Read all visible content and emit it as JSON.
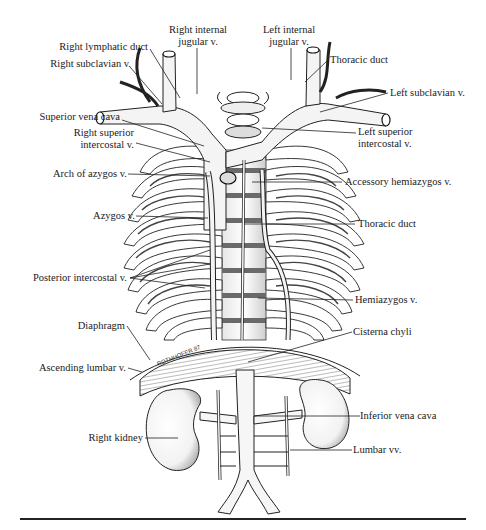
{
  "figure": {
    "signature": "ROTHHOFER 87",
    "caption_partial": "Figure 5.1"
  },
  "labels_left": {
    "right_lymphatic_duct": "Right lymphatic duct",
    "right_subclavian": "Right subclavian v.",
    "superior_vena_cava": "Superior vena cava",
    "right_superior_intercostal_1": "Right superior",
    "right_superior_intercostal_2": "intercostal v.",
    "arch_of_azygos": "Arch of azygos v.",
    "azygos": "Azygos v.",
    "posterior_intercostal": "Posterior intercostal v.",
    "diaphragm": "Diaphragm",
    "ascending_lumbar": "Ascending lumbar v.",
    "right_kidney": "Right kidney"
  },
  "labels_top": {
    "right_internal_jugular_1": "Right internal",
    "right_internal_jugular_2": "jugular v.",
    "left_internal_jugular_1": "Left internal",
    "left_internal_jugular_2": "jugular v."
  },
  "labels_right": {
    "thoracic_duct_top": "Thoracic duct",
    "left_subclavian": "Left subclavian v.",
    "left_superior_intercostal_1": "Left superior",
    "left_superior_intercostal_2": "intercostal v.",
    "accessory_hemiazygos": "Accessory hemiazygos v.",
    "thoracic_duct_mid": "Thoracic duct",
    "hemiazygos": "Hemiazygos v.",
    "cisterna_chyli": "Cisterna chyli",
    "inferior_vena_cava": "Inferior vena cava",
    "lumbar_vv": "Lumbar vv."
  },
  "colors": {
    "ink": "#1a1a1a",
    "vessel_fill": "#f4f4f4",
    "shade": "#9a9a9a",
    "background": "#ffffff"
  }
}
